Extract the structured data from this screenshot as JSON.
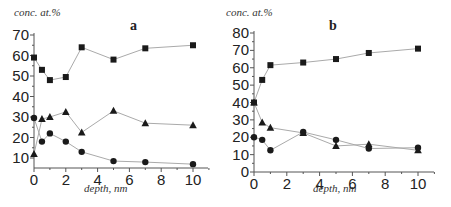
{
  "chart_data": [
    {
      "type": "line",
      "panel": "a",
      "title": "a",
      "xlabel": "depth, nm",
      "ylabel": "conc. at.%",
      "xlim": [
        0,
        11
      ],
      "ylim": [
        5,
        70
      ],
      "xticks": [
        0,
        2,
        4,
        6,
        8,
        10
      ],
      "yticks": [
        10,
        20,
        30,
        40,
        50,
        60,
        70
      ],
      "grid": false,
      "legend": null,
      "x": [
        0,
        0.5,
        1,
        2,
        3,
        5,
        7,
        10
      ],
      "series": [
        {
          "name": "square",
          "marker": "square",
          "values": [
            59,
            53,
            48,
            49.5,
            64,
            58,
            63.5,
            65
          ]
        },
        {
          "name": "triangle",
          "marker": "triangle",
          "values": [
            12,
            29,
            30,
            32.5,
            22.5,
            33,
            27,
            26
          ]
        },
        {
          "name": "circle",
          "marker": "circle",
          "values": [
            29.5,
            18,
            22,
            18,
            13,
            8.5,
            8,
            7
          ]
        }
      ]
    },
    {
      "type": "line",
      "panel": "b",
      "title": "b",
      "xlabel": "depth, nm",
      "ylabel": "conc. at.%",
      "xlim": [
        0,
        11
      ],
      "ylim": [
        0,
        80
      ],
      "xticks": [
        0,
        2,
        4,
        6,
        8,
        10
      ],
      "yticks": [
        0,
        10,
        20,
        30,
        40,
        50,
        60,
        70,
        80
      ],
      "grid": false,
      "legend": null,
      "x": [
        0,
        0.5,
        1,
        3,
        5,
        7,
        10
      ],
      "series": [
        {
          "name": "square",
          "marker": "square",
          "values": [
            40,
            53,
            61.5,
            63,
            65,
            68.5,
            71
          ]
        },
        {
          "name": "triangle",
          "marker": "triangle",
          "values": [
            40,
            28.5,
            25.5,
            22.5,
            15,
            16,
            12.5
          ]
        },
        {
          "name": "circle",
          "marker": "circle",
          "values": [
            20,
            18.5,
            12.5,
            23,
            18.5,
            13.5,
            14
          ]
        }
      ]
    }
  ],
  "labels": {
    "a": {
      "ylabel": "conc. at.%",
      "xlabel": "depth, nm",
      "panel": "a"
    },
    "b": {
      "ylabel": "conc. at.%",
      "xlabel": "depth, nm",
      "panel": "b"
    }
  }
}
